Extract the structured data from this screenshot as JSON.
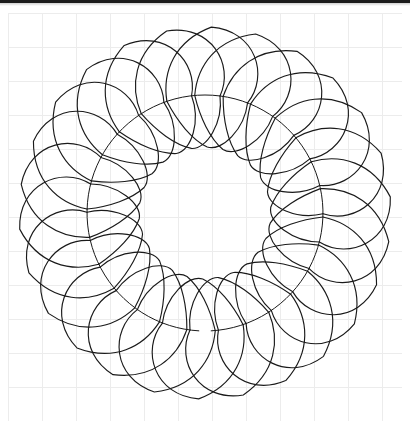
{
  "page": {
    "background_color": "#ffffff",
    "scan_bar_color": "#1c1c1c",
    "caption_cut_off_text": " "
  },
  "sheet": {
    "name": "graph-paper",
    "x": 8,
    "y": 13,
    "width": 394,
    "height": 408,
    "background_color": "#ffffff",
    "grid": {
      "visible": true,
      "cell_size": 34,
      "line_color": "#ececec",
      "line_width": 1,
      "columns": 12,
      "rows": 12
    }
  },
  "chart_data": {
    "type": "diagram",
    "subtype": "feathered-wreath",
    "stroke_color": "#1a1a1a",
    "fill_color": "none",
    "stroke_width": 1.15,
    "center": {
      "cx": 197,
      "cy": 200
    },
    "spine": {
      "name": "feather-spine",
      "shape": "circle",
      "radius": 118,
      "stroke_width": 1.0,
      "open_gap_degrees": 6,
      "gap_center_degrees": 90
    },
    "outer_plumes": {
      "count": 26,
      "direction": "outward",
      "base_radius": 118,
      "tip_radius": 186,
      "petal_radius": 33,
      "sweep_degrees": 40,
      "description": "Teardrop plumes fanning outward from the spine, each overlapping the next"
    },
    "inner_plumes": {
      "count": 26,
      "direction": "inward",
      "base_radius": 118,
      "tip_radius": 66,
      "petal_radius": 25,
      "sweep_degrees": 40,
      "description": "Smaller teardrop plumes fanning inward from the spine toward the open centre"
    },
    "center_void": {
      "radius": 64,
      "fill": "#ffffff",
      "description": "Empty white centre showing only graph-paper ruling"
    }
  }
}
